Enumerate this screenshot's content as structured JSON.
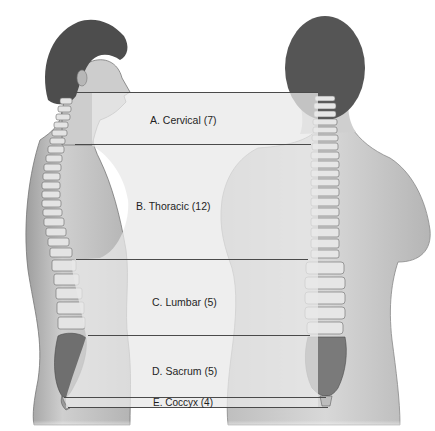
{
  "diagram": {
    "views": [
      {
        "id": "lateral",
        "description": "Side (lateral) view of torso with spine"
      },
      {
        "id": "posterior",
        "description": "Back (posterior) view of torso with spine"
      }
    ],
    "regions": [
      {
        "letter": "A",
        "name": "Cervical",
        "count": 7,
        "label": "A. Cervical (7)"
      },
      {
        "letter": "B",
        "name": "Thoracic",
        "count": 12,
        "label": "B. Thoracic (12)"
      },
      {
        "letter": "C",
        "name": "Lumbar",
        "count": 5,
        "label": "C. Lumbar (5)"
      },
      {
        "letter": "D",
        "name": "Sacrum",
        "count": 5,
        "label": "D. Sacrum (5)"
      },
      {
        "letter": "E",
        "name": "Coccyx",
        "count": 4,
        "label": "E. Coccyx (4)"
      }
    ],
    "colors": {
      "band_fill": "#e6e6e6",
      "band_line": "#4a4a4a",
      "skin": "#c9c9c9",
      "hair": "#4d4d4d",
      "bone": "#e2e2e2",
      "sacrum": "#7a7a7a"
    }
  }
}
